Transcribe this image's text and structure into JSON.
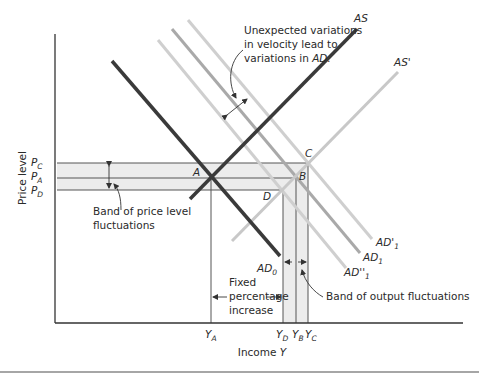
{
  "axes": {
    "y_label": "Price level",
    "x_label_prefix": "Income ",
    "x_label_var": "Y"
  },
  "price_ticks": [
    {
      "base": "P",
      "sub": "C"
    },
    {
      "base": "P",
      "sub": "A"
    },
    {
      "base": "P",
      "sub": "D"
    }
  ],
  "income_ticks": [
    {
      "base": "Y",
      "sub": "A"
    },
    {
      "base": "Y",
      "sub": "D"
    },
    {
      "base": "Y",
      "sub": "B"
    },
    {
      "base": "Y",
      "sub": "C"
    }
  ],
  "curves": {
    "as": "AS",
    "as_prime": "AS'",
    "ad0_base": "AD",
    "ad0_sub": "0",
    "ad1_base": "AD",
    "ad1_sub": "1",
    "ad1_prime_base": "AD'",
    "ad1_prime_sub": "1",
    "ad1_dprime_base": "AD''",
    "ad1_dprime_sub": "1"
  },
  "points": {
    "a": "A",
    "b": "B",
    "c": "C",
    "d": "D"
  },
  "annotations": {
    "velocity_line1": "Unexpected variations",
    "velocity_line2": "in velocity lead to",
    "velocity_line3_prefix": "variations in ",
    "velocity_line3_italic": "AD.",
    "price_band_line1": "Band of price level",
    "price_band_line2": "fluctuations",
    "fixed_line1": "Fixed",
    "fixed_line2": "percentage",
    "fixed_line3": "increase",
    "output_band": "Band of output fluctuations"
  },
  "colors": {
    "dark_curve": "#3a3a3a",
    "light_curve": "#c8c8c8",
    "mid_curve": "#a8a8a8",
    "band_fill": "#ececec",
    "axis": "#333333"
  }
}
